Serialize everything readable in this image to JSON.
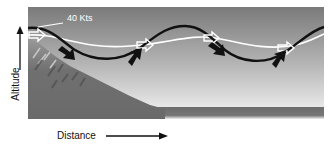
{
  "figure": {
    "wind_label": "40 Kts",
    "y_axis_label": "Altitude",
    "x_axis_label": "Distance"
  },
  "colors": {
    "sky_top": "#7e7e7e",
    "sky_bottom": "#e6e6e6",
    "mountain": "#6e6e6e",
    "ground_strip": "#6a6a6a",
    "wind_line": "#ffffff",
    "wave_line": "#111111",
    "text": "#111111"
  },
  "elements": {
    "white_wind_arrows": 4,
    "black_wave_arrows": 4
  }
}
